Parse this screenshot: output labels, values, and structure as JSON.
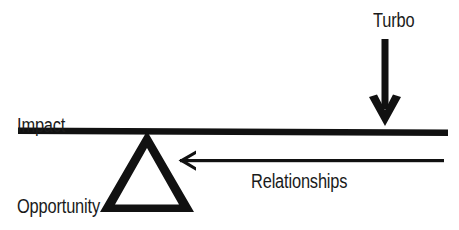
{
  "diagram": {
    "type": "seesaw-lever-metaphor",
    "background_color": "#ffffff",
    "ink_color": "#111111",
    "labels": {
      "impact": "Impact",
      "opportunity": "Opportunity",
      "turbo": "Turbo",
      "relationships": "Relationships"
    },
    "elements": {
      "beam_name": "lever-beam",
      "fulcrum_name": "fulcrum-triangle",
      "down_arrow_name": "turbo-down-arrow",
      "left_arrow_name": "relationships-left-arrow"
    }
  }
}
